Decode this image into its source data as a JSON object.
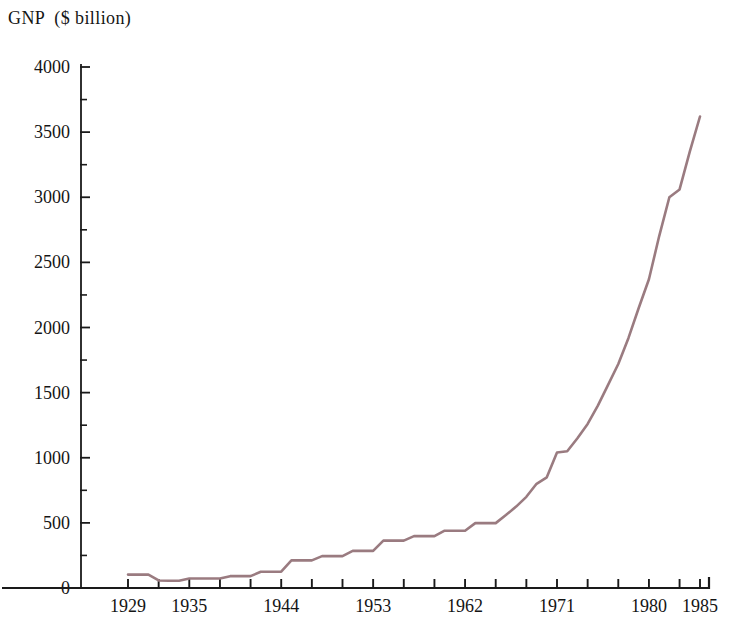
{
  "chart_data": {
    "type": "line",
    "title": "GNP  ($ billion)",
    "title_parts": {
      "series_name": "GNP",
      "units": "($ billion)"
    },
    "xlabel": "",
    "ylabel": "GNP ($ billion)",
    "xlim": [
      1927,
      1985
    ],
    "ylim": [
      0,
      4000
    ],
    "grid": false,
    "legend": null,
    "line_color": "#9a7b80",
    "axis_color": "#1a1a1a",
    "background_color": "#ffffff",
    "y_ticks_major": [
      0,
      500,
      1000,
      1500,
      2000,
      2500,
      3000,
      3500,
      4000
    ],
    "y_ticks_minor": [
      250,
      750,
      1250,
      1750,
      2250,
      2750,
      3250,
      3750
    ],
    "y_tick_labels": [
      "0",
      "500",
      "1000",
      "1500",
      "2000",
      "2500",
      "3000",
      "3500",
      "4000"
    ],
    "x_tick_labels": [
      "1929",
      "1935",
      "1944",
      "1953",
      "1962",
      "1971",
      "1980",
      "1985"
    ],
    "x_labeled_years": [
      1929,
      1935,
      1944,
      1953,
      1962,
      1971,
      1980,
      1985
    ],
    "x_ticks_all": [
      1929,
      1932,
      1935,
      1938,
      1941,
      1944,
      1947,
      1950,
      1953,
      1956,
      1959,
      1962,
      1965,
      1968,
      1971,
      1974,
      1977,
      1980,
      1983,
      1985
    ],
    "x": [
      1929,
      1930,
      1931,
      1932,
      1933,
      1934,
      1935,
      1936,
      1937,
      1938,
      1939,
      1940,
      1941,
      1942,
      1943,
      1944,
      1945,
      1946,
      1947,
      1948,
      1949,
      1950,
      1951,
      1952,
      1953,
      1954,
      1955,
      1956,
      1957,
      1958,
      1959,
      1960,
      1961,
      1962,
      1963,
      1964,
      1965,
      1966,
      1967,
      1968,
      1969,
      1970,
      1971,
      1972,
      1973,
      1974,
      1975,
      1976,
      1977,
      1978,
      1979,
      1980,
      1981,
      1982,
      1983,
      1984,
      1985
    ],
    "values": [
      103,
      103,
      103,
      58,
      56,
      56,
      73,
      73,
      73,
      73,
      91,
      91,
      91,
      125,
      125,
      125,
      212,
      212,
      212,
      245,
      245,
      245,
      285,
      285,
      285,
      364,
      364,
      364,
      398,
      398,
      398,
      440,
      440,
      440,
      498,
      498,
      498,
      510,
      560,
      625,
      700,
      800,
      850,
      1040,
      1050,
      1050,
      1215,
      1400,
      1550,
      1700,
      1900,
      2150,
      2300,
      2500,
      2700,
      3000,
      3050
    ],
    "series": [
      {
        "name": "GNP",
        "units": "$ billion",
        "points": [
          {
            "year": 1929,
            "value": 103
          },
          {
            "year": 1930,
            "value": 103
          },
          {
            "year": 1931,
            "value": 103
          },
          {
            "year": 1932,
            "value": 58
          },
          {
            "year": 1933,
            "value": 56
          },
          {
            "year": 1934,
            "value": 56
          },
          {
            "year": 1935,
            "value": 73
          },
          {
            "year": 1936,
            "value": 73
          },
          {
            "year": 1937,
            "value": 73
          },
          {
            "year": 1938,
            "value": 73
          },
          {
            "year": 1939,
            "value": 91
          },
          {
            "year": 1940,
            "value": 91
          },
          {
            "year": 1941,
            "value": 91
          },
          {
            "year": 1942,
            "value": 125
          },
          {
            "year": 1943,
            "value": 125
          },
          {
            "year": 1944,
            "value": 125
          },
          {
            "year": 1945,
            "value": 212
          },
          {
            "year": 1946,
            "value": 212
          },
          {
            "year": 1947,
            "value": 212
          },
          {
            "year": 1948,
            "value": 245
          },
          {
            "year": 1949,
            "value": 245
          },
          {
            "year": 1950,
            "value": 245
          },
          {
            "year": 1951,
            "value": 285
          },
          {
            "year": 1952,
            "value": 285
          },
          {
            "year": 1953,
            "value": 285
          },
          {
            "year": 1954,
            "value": 364
          },
          {
            "year": 1955,
            "value": 364
          },
          {
            "year": 1956,
            "value": 364
          },
          {
            "year": 1957,
            "value": 398
          },
          {
            "year": 1958,
            "value": 398
          },
          {
            "year": 1959,
            "value": 398
          },
          {
            "year": 1960,
            "value": 440
          },
          {
            "year": 1961,
            "value": 440
          },
          {
            "year": 1962,
            "value": 440
          },
          {
            "year": 1963,
            "value": 498
          },
          {
            "year": 1964,
            "value": 498
          },
          {
            "year": 1965,
            "value": 498
          },
          {
            "year": 1966,
            "value": 560
          },
          {
            "year": 1967,
            "value": 625
          },
          {
            "year": 1968,
            "value": 700
          },
          {
            "year": 1969,
            "value": 800
          },
          {
            "year": 1970,
            "value": 850
          },
          {
            "year": 1971,
            "value": 1040
          },
          {
            "year": 1972,
            "value": 1050
          },
          {
            "year": 1973,
            "value": 1150
          },
          {
            "year": 1974,
            "value": 1260
          },
          {
            "year": 1975,
            "value": 1400
          },
          {
            "year": 1976,
            "value": 1560
          },
          {
            "year": 1977,
            "value": 1720
          },
          {
            "year": 1978,
            "value": 1920
          },
          {
            "year": 1979,
            "value": 2150
          },
          {
            "year": 1980,
            "value": 2370
          },
          {
            "year": 1981,
            "value": 2700
          },
          {
            "year": 1982,
            "value": 3000
          },
          {
            "year": 1983,
            "value": 3060
          },
          {
            "year": 1984,
            "value": 3350
          },
          {
            "year": 1985,
            "value": 3620
          }
        ]
      }
    ]
  }
}
